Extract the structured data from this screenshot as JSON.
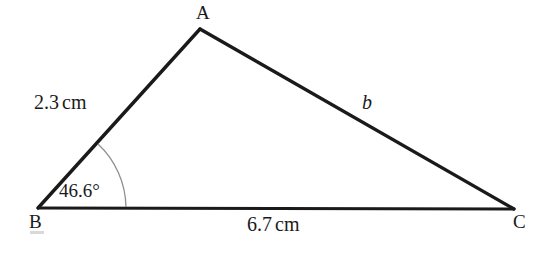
{
  "figure": {
    "type": "triangle-diagram",
    "background_color": "#ffffff",
    "stroke_color": "#1a1a1a",
    "arc_color": "#8a8a8a",
    "vertices": {
      "a": {
        "label": "A",
        "x": 200,
        "y": 29
      },
      "b": {
        "label": "B",
        "x": 38,
        "y": 208
      },
      "c": {
        "label": "C",
        "x": 514,
        "y": 209
      }
    },
    "sides": {
      "ab": {
        "label": "2.3",
        "unit": "cm"
      },
      "bc": {
        "label": "6.7",
        "unit": "cm"
      },
      "ac": {
        "label": "b"
      }
    },
    "angles": {
      "b": {
        "value": "46.6",
        "unit": "°",
        "label": "46.6°"
      }
    }
  }
}
